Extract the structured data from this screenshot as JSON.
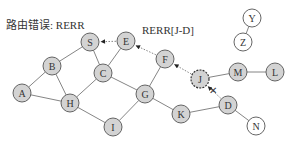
{
  "title": "路由错误: RERR",
  "annotation": "RERR[J-D]",
  "colors": {
    "node_fill": "#d3d3d3",
    "node_stroke": "#555555",
    "empty_fill": "#ffffff",
    "edge": "#666666",
    "arrow": "#222222"
  },
  "nodes": [
    {
      "id": "A",
      "x": 22,
      "y": 93,
      "filled": true
    },
    {
      "id": "B",
      "x": 52,
      "y": 66,
      "filled": true
    },
    {
      "id": "H",
      "x": 70,
      "y": 103,
      "filled": true
    },
    {
      "id": "S",
      "x": 90,
      "y": 42,
      "filled": true
    },
    {
      "id": "E",
      "x": 126,
      "y": 41,
      "filled": true
    },
    {
      "id": "C",
      "x": 103,
      "y": 73,
      "filled": true
    },
    {
      "id": "F",
      "x": 165,
      "y": 59,
      "filled": true
    },
    {
      "id": "G",
      "x": 145,
      "y": 94,
      "filled": true
    },
    {
      "id": "I",
      "x": 113,
      "y": 127,
      "filled": true
    },
    {
      "id": "K",
      "x": 181,
      "y": 114,
      "filled": true
    },
    {
      "id": "J",
      "x": 200,
      "y": 79,
      "filled": true,
      "dashed": true
    },
    {
      "id": "M",
      "x": 238,
      "y": 72,
      "filled": true
    },
    {
      "id": "L",
      "x": 275,
      "y": 72,
      "filled": true
    },
    {
      "id": "D",
      "x": 228,
      "y": 105,
      "filled": true
    },
    {
      "id": "N",
      "x": 256,
      "y": 126,
      "filled": false
    },
    {
      "id": "Y",
      "x": 252,
      "y": 18,
      "filled": false
    },
    {
      "id": "Z",
      "x": 243,
      "y": 42,
      "filled": false
    }
  ],
  "edges": [
    [
      "A",
      "B"
    ],
    [
      "A",
      "H"
    ],
    [
      "B",
      "S"
    ],
    [
      "B",
      "H"
    ],
    [
      "S",
      "C"
    ],
    [
      "C",
      "E"
    ],
    [
      "C",
      "H"
    ],
    [
      "C",
      "G"
    ],
    [
      "H",
      "I"
    ],
    [
      "I",
      "G"
    ],
    [
      "G",
      "F"
    ],
    [
      "G",
      "K"
    ],
    [
      "K",
      "D"
    ],
    [
      "J",
      "M"
    ],
    [
      "M",
      "L"
    ],
    [
      "D",
      "N"
    ],
    [
      "Y",
      "Z"
    ]
  ],
  "rerr_arrows": [
    [
      "J",
      "F"
    ],
    [
      "F",
      "E"
    ],
    [
      "E",
      "S"
    ],
    [
      "D",
      "J"
    ]
  ],
  "broken_link": {
    "from": "J",
    "to": "D",
    "mark": "✕"
  }
}
